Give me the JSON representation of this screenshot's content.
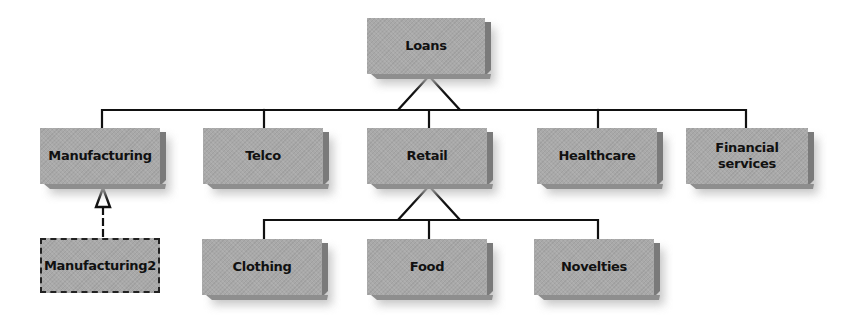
{
  "diagram": {
    "type": "class-hierarchy",
    "nodes": [
      {
        "id": "loans",
        "label": "Loans",
        "style": "solid",
        "x": 367,
        "y": 18,
        "w": 118,
        "h": 56
      },
      {
        "id": "manufacturing",
        "label": "Manufacturing",
        "style": "solid",
        "x": 40,
        "y": 128,
        "w": 120,
        "h": 56
      },
      {
        "id": "telco",
        "label": "Telco",
        "style": "solid",
        "x": 203,
        "y": 128,
        "w": 120,
        "h": 56
      },
      {
        "id": "retail",
        "label": "Retail",
        "style": "solid",
        "x": 367,
        "y": 128,
        "w": 120,
        "h": 56
      },
      {
        "id": "healthcare",
        "label": "Healthcare",
        "style": "solid",
        "x": 537,
        "y": 128,
        "w": 120,
        "h": 56
      },
      {
        "id": "financial_services",
        "label": "Financial services",
        "style": "solid",
        "x": 686,
        "y": 128,
        "w": 122,
        "h": 56
      },
      {
        "id": "manufacturing2",
        "label": "Manufacturing2",
        "style": "dashed",
        "x": 40,
        "y": 238,
        "w": 120,
        "h": 55
      },
      {
        "id": "clothing",
        "label": "Clothing",
        "style": "solid",
        "x": 202,
        "y": 239,
        "w": 120,
        "h": 56
      },
      {
        "id": "food",
        "label": "Food",
        "style": "solid",
        "x": 367,
        "y": 239,
        "w": 120,
        "h": 56
      },
      {
        "id": "novelties",
        "label": "Novelties",
        "style": "solid",
        "x": 534,
        "y": 239,
        "w": 120,
        "h": 56
      }
    ],
    "edges": [
      {
        "from": "manufacturing",
        "to": "loans",
        "type": "generalization"
      },
      {
        "from": "telco",
        "to": "loans",
        "type": "generalization"
      },
      {
        "from": "retail",
        "to": "loans",
        "type": "generalization"
      },
      {
        "from": "healthcare",
        "to": "loans",
        "type": "generalization"
      },
      {
        "from": "financial_services",
        "to": "loans",
        "type": "generalization"
      },
      {
        "from": "clothing",
        "to": "retail",
        "type": "generalization"
      },
      {
        "from": "food",
        "to": "retail",
        "type": "generalization"
      },
      {
        "from": "novelties",
        "to": "retail",
        "type": "generalization"
      },
      {
        "from": "manufacturing2",
        "to": "manufacturing",
        "type": "realization"
      }
    ],
    "colors": {
      "box_face": "#a9a9a9",
      "box_side": "#7a7a7a",
      "line": "#111111",
      "background": "#ffffff"
    }
  }
}
